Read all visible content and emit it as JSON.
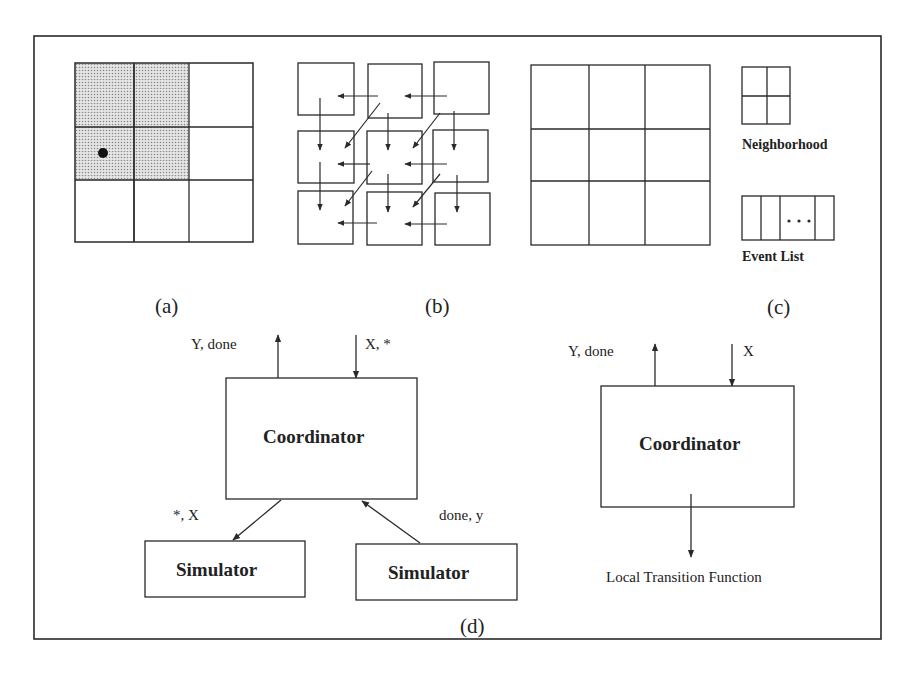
{
  "figure": {
    "panels": {
      "a": {
        "label": "(a)",
        "description": "3x3 cell grid with shaded 2x2 neighborhood and a dot in the center-left cell"
      },
      "b": {
        "label": "(b)",
        "description": "3x3 separated cells with leftward, downward and diagonal message arrows"
      },
      "c": {
        "label": "(c)",
        "description": "3x3 cell grid with legend"
      },
      "d": {
        "label": "(d)",
        "description": "Coordinator/Simulator hierarchy"
      }
    },
    "legend": {
      "neighborhood_label": "Neighborhood",
      "event_list_label": "Event List",
      "event_list_ellipsis": "• • •"
    },
    "coordinator_d": {
      "title": "Coordinator",
      "output_label": "Y, done",
      "input_label": "X, *",
      "to_simulator_label": "*, X",
      "from_simulator_label": "done, y",
      "simulators": [
        {
          "title": "Simulator"
        },
        {
          "title": "Simulator"
        }
      ]
    },
    "coordinator_c": {
      "title": "Coordinator",
      "output_label": "Y, done",
      "input_label": "X",
      "bottom_label": "Local Transition Function"
    }
  },
  "colors": {
    "stroke": "#2a2a2a",
    "shade": "#bdbdbd",
    "background": "#ffffff"
  }
}
